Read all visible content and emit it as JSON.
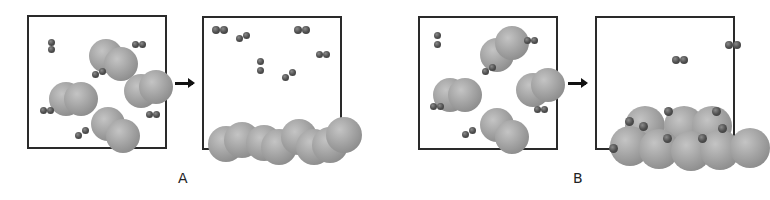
{
  "figure": {
    "labels": [
      {
        "id": "A",
        "text": "A",
        "x": 178,
        "y": 170
      },
      {
        "id": "B",
        "text": "B",
        "x": 573,
        "y": 170
      }
    ],
    "arrows": [
      {
        "id": "arrow-A",
        "x": 175,
        "y": 82,
        "w": 18
      },
      {
        "id": "arrow-B",
        "x": 568,
        "y": 82,
        "w": 18
      }
    ],
    "colors": {
      "border": "#2a2a2a",
      "large_atom": "#a3a3a3",
      "small_atom": "#505050",
      "arrow": "#111111"
    },
    "panels": [
      {
        "id": "A-before",
        "x": 27,
        "y": 15,
        "w": 140,
        "h": 134,
        "large_atoms": [
          [
            60,
            22,
            17
          ],
          [
            75,
            30,
            17
          ],
          [
            20,
            65,
            17
          ],
          [
            35,
            65,
            17
          ],
          [
            95,
            57,
            17
          ],
          [
            110,
            53,
            17
          ],
          [
            62,
            90,
            17
          ],
          [
            77,
            102,
            17
          ]
        ],
        "small_atoms": [
          [
            19,
            22,
            7
          ],
          [
            19,
            29,
            7
          ],
          [
            103,
            24,
            7
          ],
          [
            110,
            24,
            7
          ],
          [
            63,
            54,
            7
          ],
          [
            70,
            51,
            7
          ],
          [
            11,
            90,
            7
          ],
          [
            18,
            90,
            7
          ],
          [
            117,
            94,
            7
          ],
          [
            124,
            94,
            7
          ],
          [
            46,
            115,
            7
          ],
          [
            53,
            110,
            7
          ]
        ]
      },
      {
        "id": "A-after",
        "x": 202,
        "y": 16,
        "w": 140,
        "h": 134,
        "large_atoms": [
          [
            4,
            108,
            18
          ],
          [
            20,
            104,
            18
          ],
          [
            42,
            107,
            18
          ],
          [
            57,
            111,
            18
          ],
          [
            77,
            101,
            18
          ],
          [
            92,
            111,
            18
          ],
          [
            108,
            109,
            18
          ],
          [
            122,
            99,
            18
          ]
        ],
        "small_atoms": [
          [
            8,
            8,
            8
          ],
          [
            16,
            8,
            8
          ],
          [
            32,
            17,
            7
          ],
          [
            39,
            14,
            7
          ],
          [
            90,
            8,
            8
          ],
          [
            98,
            8,
            8
          ],
          [
            112,
            33,
            7
          ],
          [
            119,
            33,
            7
          ],
          [
            53,
            40,
            7
          ],
          [
            53,
            49,
            7
          ],
          [
            78,
            56,
            7
          ],
          [
            85,
            51,
            7
          ]
        ]
      },
      {
        "id": "B-before",
        "x": 418,
        "y": 16,
        "w": 140,
        "h": 134,
        "large_atoms": [
          [
            60,
            20,
            17
          ],
          [
            75,
            8,
            17
          ],
          [
            13,
            60,
            17
          ],
          [
            28,
            60,
            17
          ],
          [
            96,
            55,
            17
          ],
          [
            111,
            50,
            17
          ],
          [
            60,
            90,
            17
          ],
          [
            75,
            102,
            17
          ]
        ],
        "small_atoms": [
          [
            14,
            14,
            7
          ],
          [
            14,
            23,
            7
          ],
          [
            104,
            19,
            7
          ],
          [
            111,
            19,
            7
          ],
          [
            62,
            50,
            7
          ],
          [
            69,
            46,
            7
          ],
          [
            10,
            85,
            7
          ],
          [
            17,
            85,
            7
          ],
          [
            114,
            88,
            7
          ],
          [
            121,
            88,
            7
          ],
          [
            42,
            113,
            7
          ],
          [
            49,
            109,
            7
          ]
        ]
      },
      {
        "id": "B-after",
        "x": 595,
        "y": 16,
        "w": 140,
        "h": 134,
        "large_atoms": [
          [
            28,
            88,
            20
          ],
          [
            67,
            88,
            20
          ],
          [
            95,
            88,
            20
          ],
          [
            13,
            108,
            20
          ],
          [
            42,
            111,
            20
          ],
          [
            74,
            113,
            20
          ],
          [
            103,
            112,
            20
          ],
          [
            133,
            110,
            20
          ]
        ],
        "small_atoms": [
          [
            28,
            99,
            9
          ],
          [
            67,
            89,
            9
          ],
          [
            115,
            89,
            9
          ],
          [
            12,
            126,
            9
          ],
          [
            42,
            104,
            9
          ],
          [
            66,
            116,
            9
          ],
          [
            101,
            116,
            9
          ],
          [
            121,
            106,
            9
          ],
          [
            128,
            23,
            8
          ],
          [
            136,
            23,
            8
          ],
          [
            75,
            38,
            8
          ],
          [
            83,
            38,
            8
          ]
        ]
      }
    ]
  }
}
